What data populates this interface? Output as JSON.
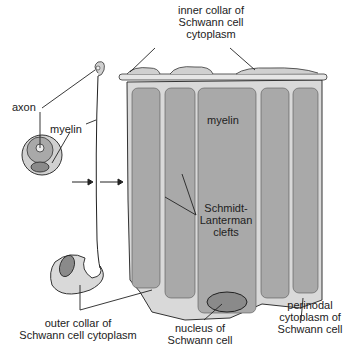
{
  "diagram": {
    "labels": {
      "inner_collar": [
        "inner collar of",
        "Schwann cell",
        "cytoplasm"
      ],
      "axon": "axon",
      "myelin_small": "myelin",
      "myelin_large": "myelin",
      "schmidt_lanterman": [
        "Schmidt-",
        "Lanterman",
        "clefts"
      ],
      "outer_collar": [
        "outer collar of",
        "Schwann cell cytoplasm"
      ],
      "nucleus": [
        "nucleus of",
        "Schwann cell"
      ],
      "perinodal": [
        "perinodal",
        "cytoplasm of",
        "Schwann cell"
      ]
    },
    "colors": {
      "myelin": "#a9a9a9",
      "cytoplasm": "#d9d9d9",
      "nucleus": "#8a8a8a",
      "outline": "#333333"
    }
  }
}
